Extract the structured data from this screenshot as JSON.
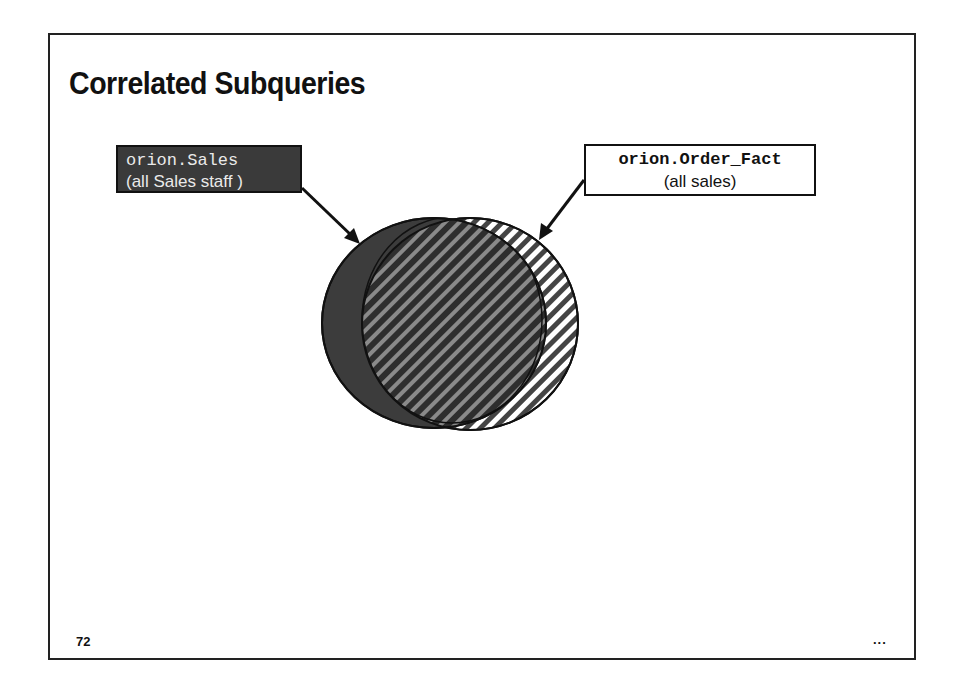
{
  "slide": {
    "title": "Correlated Subqueries",
    "page_number": "72",
    "continuation_marker": "..."
  },
  "labels": {
    "sales": {
      "code": "orion.Sales",
      "description": "(all Sales staff )"
    },
    "order_fact": {
      "code": "orion.Order_Fact",
      "description": "(all sales)"
    }
  },
  "venn": {
    "sets": [
      {
        "name": "orion.Sales",
        "fill": "#3c3c3c",
        "pattern": "solid dark gray"
      },
      {
        "name": "orion.Order_Fact",
        "fill": "#ffffff",
        "pattern": "diagonal stripes"
      }
    ],
    "overlap_pattern": "dark diagonal stripes"
  },
  "colors": {
    "dark_fill": "#3a3a3a",
    "stroke": "#111111",
    "stripe_light": "#b8b8b8"
  }
}
